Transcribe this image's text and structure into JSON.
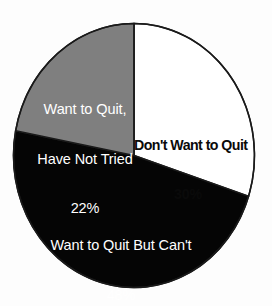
{
  "chart_data": {
    "type": "pie",
    "title": "",
    "subtitle": "",
    "xlabel": "",
    "ylabel": "",
    "legend": "none",
    "grid": false,
    "start_angle_deg": 0,
    "direction": "clockwise",
    "categories": [
      "Don't Want to Quit",
      "Want to Quit But Can't",
      "Want to Quit, Have Not Tried"
    ],
    "values": [
      30,
      48,
      22
    ],
    "unit": "%",
    "slices": [
      {
        "label": "Don't Want to Quit",
        "label_line1": "Don't Want to Quit",
        "value": 30,
        "value_label": "30%",
        "fill": "#ffffff",
        "text_color": "#0a0a0a",
        "start_deg": 0,
        "end_deg": 108
      },
      {
        "label": "Want to Quit But Can't",
        "label_line1": "Want to Quit But Can't",
        "value": 48,
        "value_label": "48%",
        "fill": "#050505",
        "text_color": "#ffffff",
        "start_deg": 108,
        "end_deg": 280.8
      },
      {
        "label": "Want to Quit, Have Not Tried",
        "label_line1": "Want to Quit,",
        "label_line2": "Have Not Tried",
        "value": 22,
        "value_label": "22%",
        "fill": "#7f7f7f",
        "text_color": "#ffffff",
        "start_deg": 280.8,
        "end_deg": 360
      }
    ]
  },
  "colors": {
    "background": "#fdfdfd",
    "gray_slice": "#7f7f7f",
    "black_slice": "#050505",
    "white_slice": "#ffffff",
    "outline": "#1a1a1a"
  }
}
